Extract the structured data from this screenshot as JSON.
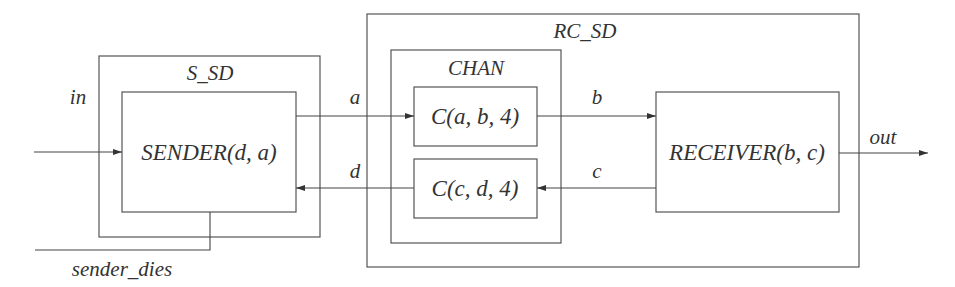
{
  "diagram": {
    "containers": {
      "s_sd": {
        "label": "S_SD"
      },
      "rc_sd": {
        "label": "RC_SD"
      },
      "chan": {
        "label": "CHAN"
      }
    },
    "processes": {
      "sender": {
        "label": "SENDER(d, a)"
      },
      "channel_ab": {
        "label": "C(a, b, 4)"
      },
      "channel_cd": {
        "label": "C(c, d, 4)"
      },
      "receiver": {
        "label": "RECEIVER(b, c)"
      }
    },
    "signals": {
      "in": "in",
      "out": "out",
      "a": "a",
      "b": "b",
      "c": "c",
      "d": "d",
      "sender_dies": "sender_dies"
    }
  }
}
